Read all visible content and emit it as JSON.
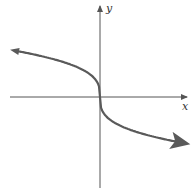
{
  "graph": {
    "x_label": "x",
    "y_label": "y",
    "function": "y = -cbrt(x)",
    "colors": {
      "axis": "#555555",
      "curve": "#5a5a5a",
      "background": "#ffffff"
    }
  }
}
